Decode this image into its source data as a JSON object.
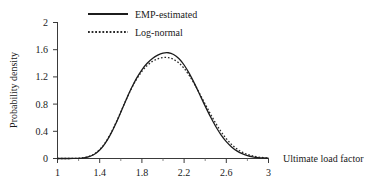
{
  "chart_data": {
    "type": "line",
    "title": "",
    "xlabel": "Ultimate load factor",
    "ylabel": "Probability density",
    "xlim": [
      1,
      3
    ],
    "ylim": [
      0,
      2
    ],
    "xticks": [
      "1",
      "1.4",
      "1.8",
      "2.2",
      "2.6",
      "3"
    ],
    "xtick_values": [
      1,
      1.4,
      1.8,
      2.2,
      2.6,
      3
    ],
    "xminor_ticks": [
      1.2,
      1.6,
      2.0,
      2.4,
      2.8
    ],
    "yticks": [
      "0",
      "0.4",
      "0.8",
      "1.2",
      "1.6",
      "2"
    ],
    "ytick_values": [
      0,
      0.4,
      0.8,
      1.2,
      1.6,
      2
    ],
    "grid": false,
    "legend_position": "top-center",
    "legend": [
      {
        "name": "EMP-estimated",
        "style": "solid"
      },
      {
        "name": "Log-normal",
        "style": "dotted"
      }
    ],
    "x": [
      1.0,
      1.05,
      1.1,
      1.15,
      1.2,
      1.25,
      1.3,
      1.35,
      1.4,
      1.45,
      1.5,
      1.55,
      1.6,
      1.65,
      1.7,
      1.75,
      1.8,
      1.85,
      1.9,
      1.95,
      2.0,
      2.05,
      2.1,
      2.15,
      2.2,
      2.25,
      2.3,
      2.35,
      2.4,
      2.45,
      2.5,
      2.55,
      2.6,
      2.65,
      2.7,
      2.75,
      2.8,
      2.85,
      2.9,
      2.95,
      3.0
    ],
    "series": [
      {
        "name": "EMP-estimated",
        "style": "solid",
        "values": [
          0.0,
          0.0,
          0.0,
          0.001,
          0.003,
          0.01,
          0.027,
          0.062,
          0.124,
          0.219,
          0.348,
          0.505,
          0.68,
          0.861,
          1.032,
          1.182,
          1.305,
          1.4,
          1.47,
          1.52,
          1.55,
          1.555,
          1.53,
          1.47,
          1.375,
          1.248,
          1.098,
          0.935,
          0.77,
          0.613,
          0.47,
          0.348,
          0.248,
          0.17,
          0.112,
          0.071,
          0.043,
          0.025,
          0.014,
          0.008,
          0.004
        ]
      },
      {
        "name": "Log-normal",
        "style": "dotted",
        "values": [
          0.0,
          0.0,
          0.0,
          0.001,
          0.004,
          0.012,
          0.031,
          0.068,
          0.131,
          0.227,
          0.356,
          0.513,
          0.686,
          0.862,
          1.026,
          1.168,
          1.282,
          1.368,
          1.428,
          1.466,
          1.485,
          1.483,
          1.458,
          1.405,
          1.325,
          1.218,
          1.09,
          0.948,
          0.8,
          0.655,
          0.518,
          0.396,
          0.292,
          0.207,
          0.142,
          0.094,
          0.06,
          0.037,
          0.022,
          0.013,
          0.007
        ]
      }
    ],
    "peak": {
      "x": 1.98,
      "value_emp": 1.79,
      "value_lognormal": 1.75
    },
    "colors": {
      "emp_estimated": "#1c1c1c",
      "log_normal": "#2a2a2a",
      "axis": "#3a3a3a"
    }
  }
}
